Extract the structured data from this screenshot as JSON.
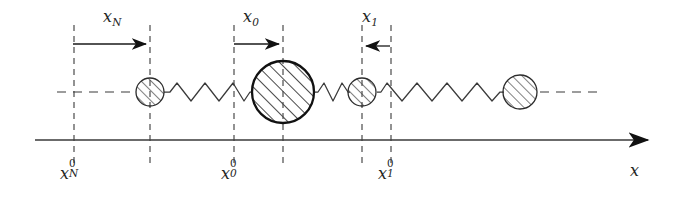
{
  "figure": {
    "kind": "mass-spring-chain-displacement-diagram",
    "background_color": "#ffffff",
    "line_color": "#333333",
    "hatch_color": "#555555",
    "axis": {
      "label": "x",
      "y": 140,
      "x_start": 35,
      "x_end": 655,
      "arrow": "right"
    },
    "equilibrium_line": {
      "style": "dashed",
      "y": 92,
      "x_start": 57,
      "x_end": 557
    }
  },
  "displacement_labels": [
    {
      "name": "x_N",
      "base": "x",
      "sub": "N",
      "x": 112,
      "y": 10,
      "arrow_direction": "right",
      "arrow_x1": 73,
      "arrow_x2": 150,
      "arrow_y": 44
    },
    {
      "name": "x_0",
      "base": "x",
      "sub": "0",
      "x": 250,
      "y": 10,
      "arrow_direction": "right",
      "arrow_x1": 234,
      "arrow_x2": 283,
      "arrow_y": 44
    },
    {
      "name": "x_1",
      "base": "x",
      "sub": "1",
      "x": 367,
      "y": 10,
      "arrow_direction": "left",
      "arrow_x1": 390,
      "arrow_x2": 362,
      "arrow_y": 46
    }
  ],
  "equilibrium_labels": [
    {
      "name": "x_N_0",
      "base": "x",
      "sub": "N",
      "sup": "0",
      "tick_x": 74,
      "x": 62,
      "y": 164
    },
    {
      "name": "x_0_0",
      "base": "x",
      "sub": "0",
      "sup": "0",
      "tick_x": 234,
      "x": 222,
      "y": 164
    },
    {
      "name": "x_1_0",
      "base": "x",
      "sub": "1",
      "sup": "0",
      "tick_x": 391,
      "x": 379,
      "y": 164
    }
  ],
  "axis_label": {
    "base": "x",
    "x": 632,
    "y": 164
  },
  "dashed_verticals": [
    {
      "name": "vline-xN0",
      "x": 74,
      "y_top": 25,
      "y_bottom": 166
    },
    {
      "name": "vline-mass-N",
      "x": 150,
      "y_top": 25,
      "y_bottom": 166
    },
    {
      "name": "vline-x00",
      "x": 234,
      "y_top": 25,
      "y_bottom": 166
    },
    {
      "name": "vline-mass-0",
      "x": 283,
      "y_top": 25,
      "y_bottom": 166
    },
    {
      "name": "vline-mass-1",
      "x": 362,
      "y_top": 25,
      "y_bottom": 166
    },
    {
      "name": "vline-x10",
      "x": 391,
      "y_top": 25,
      "y_bottom": 166
    }
  ],
  "masses": [
    {
      "name": "mass-N",
      "cx": 150,
      "cy": 92,
      "r": 14,
      "stroke_width": 1.2,
      "hatch": "diagonal"
    },
    {
      "name": "mass-0",
      "cx": 283,
      "cy": 92,
      "r": 31,
      "stroke_width": 2.2,
      "hatch": "diagonal"
    },
    {
      "name": "mass-1",
      "cx": 362,
      "cy": 92,
      "r": 14,
      "stroke_width": 1.2,
      "hatch": "diagonal"
    },
    {
      "name": "mass-right",
      "cx": 520,
      "cy": 92,
      "r": 17,
      "stroke_width": 1.2,
      "hatch": "diagonal"
    }
  ],
  "springs": [
    {
      "name": "spring-N-to-0",
      "x1": 166,
      "x2": 250,
      "y": 92,
      "coils": 6,
      "amplitude": 9
    },
    {
      "name": "spring-0-to-1",
      "x1": 315,
      "x2": 347,
      "y": 92,
      "coils": 3,
      "amplitude": 9
    },
    {
      "name": "spring-1-to-right",
      "x1": 379,
      "x2": 503,
      "y": 92,
      "coils": 8,
      "amplitude": 9
    }
  ],
  "dashed_continuations": [
    {
      "name": "dashes-left-of-mass-N",
      "x1": 57,
      "x2": 136,
      "y": 92
    },
    {
      "name": "dashes-right-of-mass-right",
      "x1": 540,
      "x2": 600,
      "y": 92
    }
  ]
}
